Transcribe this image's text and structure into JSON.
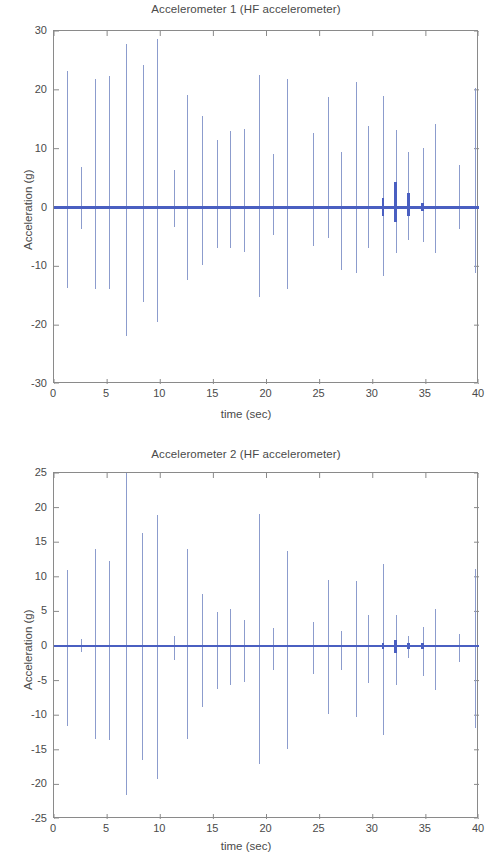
{
  "figure": {
    "width": 492,
    "height": 859,
    "background": "#ffffff",
    "axis_color": "#8a8a8a",
    "text_color": "#4a4a4a"
  },
  "colors": {
    "spike": "#8c9ccd",
    "baseline": "#4a5fc1",
    "accent": "#4a5fc1"
  },
  "chart_data": [
    {
      "id": "accelerometer-1",
      "type": "line",
      "title": "Accelerometer 1 (HF accelerometer)",
      "xlabel": "time (sec)",
      "ylabel": "Acceleration (g)",
      "xlim": [
        0,
        40
      ],
      "ylim": [
        -30,
        30
      ],
      "xticks": [
        0,
        5,
        10,
        15,
        20,
        25,
        30,
        35,
        40
      ],
      "yticks": [
        30,
        20,
        10,
        0,
        -10,
        -20,
        -30
      ],
      "grid": false,
      "legend": null,
      "baseline": 0,
      "series": [
        {
          "name": "Acceleration",
          "style": "impulse-spikes",
          "note": "vertical impulse spikes on a zero baseline; each point is [time_sec, max_g, min_g]",
          "spikes": [
            [
              1.25,
              23.2,
              -13.6
            ],
            [
              2.55,
              6.8,
              -3.6
            ],
            [
              3.95,
              21.9,
              -13.9
            ],
            [
              5.2,
              22.3,
              -13.8
            ],
            [
              6.85,
              27.8,
              -21.9
            ],
            [
              8.4,
              24.2,
              -16.0
            ],
            [
              9.75,
              28.6,
              -19.4
            ],
            [
              11.35,
              6.4,
              -3.3
            ],
            [
              12.6,
              19.2,
              -12.4
            ],
            [
              13.95,
              15.6,
              -9.8
            ],
            [
              15.35,
              11.4,
              -6.9
            ],
            [
              16.6,
              13.0,
              -6.8
            ],
            [
              17.95,
              13.4,
              -7.6
            ],
            [
              19.35,
              22.6,
              -15.2
            ],
            [
              20.65,
              9.1,
              -4.7
            ],
            [
              22.0,
              21.8,
              -13.8
            ],
            [
              24.4,
              12.6,
              -6.6
            ],
            [
              25.8,
              18.8,
              -5.1
            ],
            [
              27.05,
              9.4,
              -10.7
            ],
            [
              28.45,
              21.4,
              -11.2
            ],
            [
              29.6,
              13.8,
              -6.8
            ],
            [
              31.0,
              19.0,
              -11.6
            ],
            [
              32.2,
              13.2,
              -7.7
            ],
            [
              33.4,
              9.4,
              -5.6
            ],
            [
              34.75,
              10.1,
              -5.9
            ],
            [
              35.95,
              14.2,
              -7.8
            ],
            [
              38.15,
              7.3,
              -3.6
            ],
            [
              39.7,
              20.3,
              -11.2
            ]
          ],
          "thick_bursts": [
            [
              30.95,
              1.6,
              -1.5
            ],
            [
              32.15,
              4.4,
              -2.4
            ],
            [
              33.35,
              2.5,
              -1.4
            ],
            [
              34.7,
              0.7,
              -0.6
            ]
          ]
        }
      ]
    },
    {
      "id": "accelerometer-2",
      "type": "line",
      "title": "Accelerometer 2 (HF accelerometer)",
      "xlabel": "time (sec)",
      "ylabel": "Acceleration (g)",
      "xlim": [
        0,
        40
      ],
      "ylim": [
        -25,
        25
      ],
      "xticks": [
        0,
        5,
        10,
        15,
        20,
        25,
        30,
        35,
        40
      ],
      "yticks": [
        25,
        20,
        15,
        10,
        5,
        0,
        -5,
        -10,
        -15,
        -20,
        -25
      ],
      "grid": false,
      "legend": null,
      "baseline": 0,
      "series": [
        {
          "name": "Acceleration",
          "style": "impulse-spikes",
          "note": "vertical impulse spikes on a zero baseline; each point is [time_sec, max_g, min_g]",
          "spikes": [
            [
              1.25,
              11.0,
              -11.6
            ],
            [
              2.55,
              1.0,
              -0.9
            ],
            [
              3.95,
              14.0,
              -13.5
            ],
            [
              5.2,
              12.3,
              -13.6
            ],
            [
              6.85,
              26.0,
              -21.5
            ],
            [
              8.35,
              16.4,
              -16.5
            ],
            [
              9.75,
              19.0,
              -19.2
            ],
            [
              11.35,
              1.5,
              -2.0
            ],
            [
              12.6,
              14.0,
              -13.4
            ],
            [
              13.95,
              7.5,
              -8.8
            ],
            [
              15.35,
              4.9,
              -6.2
            ],
            [
              16.6,
              5.4,
              -5.7
            ],
            [
              17.95,
              3.7,
              -5.2
            ],
            [
              19.35,
              19.1,
              -17.1
            ],
            [
              20.65,
              2.6,
              -3.4
            ],
            [
              22.0,
              13.7,
              -14.9
            ],
            [
              24.4,
              3.5,
              -4.1
            ],
            [
              25.8,
              9.5,
              -9.8
            ],
            [
              27.05,
              2.2,
              -3.4
            ],
            [
              28.45,
              9.4,
              -10.2
            ],
            [
              29.6,
              4.5,
              -5.3
            ],
            [
              31.0,
              11.8,
              -12.9
            ],
            [
              32.2,
              4.5,
              -5.6
            ],
            [
              33.4,
              1.4,
              -1.8
            ],
            [
              34.75,
              2.8,
              -4.3
            ],
            [
              35.95,
              5.4,
              -6.3
            ],
            [
              38.15,
              1.8,
              -2.3
            ],
            [
              39.7,
              11.1,
              -11.8
            ]
          ],
          "thick_bursts": [
            [
              30.95,
              0.4,
              -0.4
            ],
            [
              32.15,
              0.9,
              -1.0
            ],
            [
              33.35,
              0.5,
              -0.5
            ],
            [
              34.7,
              0.4,
              -0.4
            ]
          ]
        }
      ]
    }
  ]
}
